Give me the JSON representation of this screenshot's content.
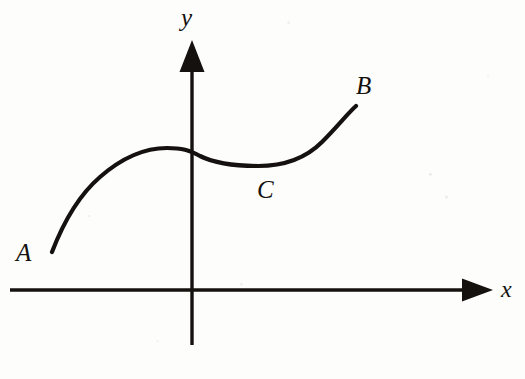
{
  "figure": {
    "background_color": "#fdfdfc",
    "ink_color": "#14110f",
    "width": 525,
    "height": 379
  },
  "axes": {
    "x_axis": {
      "label": "x",
      "icon": "arrow-right-icon",
      "line_y": 290,
      "line_start_x": 10,
      "line_end_x": 465,
      "arrow_tip_x": 493
    },
    "y_axis": {
      "label": "y",
      "icon": "arrow-up-icon",
      "line_x": 192,
      "line_bottom_y": 345,
      "line_top_y": 72,
      "arrow_tip_y": 40
    },
    "origin": {
      "x": 192,
      "y": 290
    }
  },
  "labels": {
    "point_a": "A",
    "point_b": "B",
    "point_c": "C"
  },
  "chart_data": {
    "type": "line",
    "xlabel": "x",
    "ylabel": "y",
    "grid": false,
    "legend": null,
    "axis_style": "arrow-terminated cartesian axes through origin",
    "annotations": [
      {
        "label": "A",
        "role": "left endpoint of curve",
        "px": [
          52,
          252
        ],
        "text_px": [
          26,
          255
        ]
      },
      {
        "label": "B",
        "role": "right endpoint of curve",
        "px": [
          356,
          106
        ],
        "text_px": [
          366,
          88
        ]
      },
      {
        "label": "C",
        "role": "label near local minimum of curve",
        "px": [
          258,
          166
        ],
        "text_px": [
          268,
          192
        ]
      }
    ],
    "features": [
      {
        "name": "left endpoint",
        "px": [
          52,
          252
        ]
      },
      {
        "name": "local maximum",
        "px": [
          167,
          148
        ]
      },
      {
        "name": "y-axis crossing",
        "px": [
          192,
          152
        ]
      },
      {
        "name": "local minimum",
        "px": [
          258,
          166
        ]
      },
      {
        "name": "right endpoint",
        "px": [
          356,
          106
        ]
      }
    ],
    "series": [
      {
        "name": "curve",
        "stroke": "#14110f",
        "stroke_width": 4.2,
        "path": "M 52 252 C 62 226 78 196 100 177 C 124 156 148 148 167 148 C 182 148 189 150 200 156 C 214 163 232 166 258 166 C 283 166 305 159 322 142 C 338 126 348 113 356 106"
      }
    ]
  }
}
